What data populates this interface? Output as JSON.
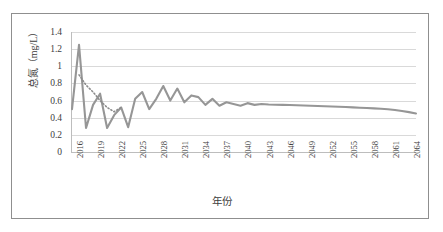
{
  "chart_data": {
    "type": "line",
    "title": "",
    "xlabel": "年份",
    "ylabel": "总氮（mg/L）",
    "ylim": [
      0,
      1.4
    ],
    "ytick_labels": [
      "0",
      "0.2",
      "0.4",
      "0.6",
      "0.8",
      "1",
      "1.2",
      "1.4"
    ],
    "ytick_values": [
      0,
      0.2,
      0.4,
      0.6,
      0.8,
      1,
      1.2,
      1.4
    ],
    "xlim": [
      2016,
      2065
    ],
    "xtick_labels": [
      "2016",
      "2019",
      "2022",
      "2025",
      "2028",
      "2031",
      "2034",
      "2037",
      "2040",
      "2043",
      "2046",
      "2049",
      "2052",
      "2055",
      "2058",
      "2061",
      "2064"
    ],
    "xtick_values": [
      2016,
      2019,
      2022,
      2025,
      2028,
      2031,
      2034,
      2037,
      2040,
      2043,
      2046,
      2049,
      2052,
      2055,
      2058,
      2061,
      2064
    ],
    "grid": true,
    "legend": "none",
    "line_color": "#969696",
    "trend_color": "#8c8c8c",
    "trend_style": "dotted",
    "series": [
      {
        "name": "总氮",
        "style": "solid",
        "x": [
          2016,
          2017,
          2018,
          2019,
          2020,
          2021,
          2022,
          2023,
          2024,
          2025,
          2026,
          2027,
          2028,
          2029,
          2030,
          2031,
          2032,
          2033,
          2034,
          2035,
          2036,
          2037,
          2038,
          2039,
          2040,
          2041,
          2042,
          2043,
          2044,
          2045,
          2046,
          2047,
          2048,
          2049,
          2050,
          2051,
          2052,
          2053,
          2054,
          2055,
          2056,
          2057,
          2058,
          2059,
          2060,
          2061,
          2062,
          2063,
          2064,
          2065
        ],
        "values": [
          0.5,
          1.25,
          0.28,
          0.55,
          0.68,
          0.28,
          0.43,
          0.52,
          0.29,
          0.62,
          0.7,
          0.5,
          0.62,
          0.77,
          0.6,
          0.74,
          0.58,
          0.66,
          0.64,
          0.55,
          0.62,
          0.54,
          0.58,
          0.56,
          0.54,
          0.57,
          0.55,
          0.56,
          0.555,
          0.552,
          0.55,
          0.548,
          0.545,
          0.542,
          0.54,
          0.537,
          0.534,
          0.531,
          0.528,
          0.525,
          0.521,
          0.517,
          0.513,
          0.509,
          0.504,
          0.499,
          0.49,
          0.478,
          0.465,
          0.45
        ]
      },
      {
        "name": "趋势线",
        "style": "dotted",
        "x": [
          2017,
          2018,
          2019,
          2020,
          2021,
          2022,
          2023
        ],
        "values": [
          0.9,
          0.78,
          0.7,
          0.6,
          0.52,
          0.47,
          0.52
        ]
      }
    ]
  },
  "axes": {
    "x_title": "年份",
    "y_title": "总氮（mg/L）"
  }
}
